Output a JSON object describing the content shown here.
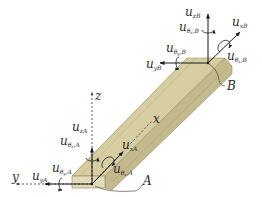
{
  "diagram": {
    "type": "3D beam element with nodal degrees of freedom",
    "colors": {
      "beam_face_top": "#d9d0a8",
      "beam_face_side": "#c4b98c",
      "beam_face_end": "#e2dab8",
      "stroke": "#1a1a1a",
      "axis": "#333333"
    },
    "axes": {
      "x": "x",
      "y": "y",
      "z": "z"
    },
    "nodes": {
      "A": {
        "label": "A",
        "dofs": {
          "u_zA": {
            "base": "u",
            "sub": "zA"
          },
          "u_thzA": {
            "base": "u",
            "sub": "θ",
            "sub2": "z",
            "sub3": ",A"
          },
          "u_thyA": {
            "base": "u",
            "sub": "θ",
            "sub2": "y",
            "sub3": ",A"
          },
          "u_yA": {
            "base": "u",
            "sub": "yA"
          },
          "u_xA": {
            "base": "u",
            "sub": "xA"
          },
          "u_thxA": {
            "base": "u",
            "sub": "θ",
            "sub2": "x",
            "sub3": ",A"
          }
        }
      },
      "B": {
        "label": "B",
        "dofs": {
          "u_zB": {
            "base": "u",
            "sub": "zB"
          },
          "u_thzB": {
            "base": "u",
            "sub": "θ",
            "sub2": "z",
            "sub3": ",B"
          },
          "u_thyB": {
            "base": "u",
            "sub": "θ",
            "sub2": "y",
            "sub3": ",B"
          },
          "u_yB": {
            "base": "u",
            "sub": "yB"
          },
          "u_xB": {
            "base": "u",
            "sub": "xB"
          },
          "u_thxB": {
            "base": "u",
            "sub": "θ",
            "sub2": "x",
            "sub3": ",B"
          }
        }
      }
    }
  }
}
